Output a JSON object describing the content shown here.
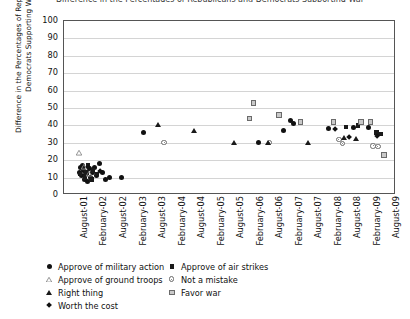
{
  "chart_data": {
    "type": "scatter",
    "title": "Difference in the Percentages of Republicans and Democrats Supporting War",
    "xlabel": "",
    "ylabel": "Difference in the Percentages of Republicans and Democrats Supporting War",
    "ylim": [
      0,
      100
    ],
    "yticks": [
      0,
      10,
      20,
      30,
      40,
      50,
      60,
      70,
      80,
      90,
      100
    ],
    "grid": true,
    "legend_position": "below-axes",
    "xticks": [
      "August-01",
      "February-02",
      "August-02",
      "February-03",
      "August-03",
      "February-04",
      "August-04",
      "February-05",
      "August-05",
      "February-06",
      "August-06",
      "February-07",
      "August-07",
      "February-08",
      "August-08",
      "February-09",
      "August-09"
    ],
    "series": [
      {
        "name": "Approve of military action",
        "marker": "circle-filled",
        "color": "#111111",
        "points": [
          {
            "x": 0.3,
            "y": 13
          },
          {
            "x": 0.36,
            "y": 16
          },
          {
            "x": 0.4,
            "y": 11
          },
          {
            "x": 0.44,
            "y": 17
          },
          {
            "x": 0.5,
            "y": 14
          },
          {
            "x": 0.55,
            "y": 9
          },
          {
            "x": 0.62,
            "y": 12
          },
          {
            "x": 0.7,
            "y": 8
          },
          {
            "x": 0.78,
            "y": 15
          },
          {
            "x": 0.85,
            "y": 10
          },
          {
            "x": 0.95,
            "y": 13
          },
          {
            "x": 1.05,
            "y": 16
          },
          {
            "x": 1.15,
            "y": 11
          },
          {
            "x": 1.3,
            "y": 18
          },
          {
            "x": 1.45,
            "y": 13
          },
          {
            "x": 1.6,
            "y": 9
          },
          {
            "x": 1.85,
            "y": 10
          },
          {
            "x": 2.45,
            "y": 10
          },
          {
            "x": 3.55,
            "y": 36
          },
          {
            "x": 9.45,
            "y": 30
          },
          {
            "x": 10.75,
            "y": 37
          },
          {
            "x": 11.1,
            "y": 43
          },
          {
            "x": 11.25,
            "y": 41
          },
          {
            "x": 13.05,
            "y": 38
          },
          {
            "x": 14.3,
            "y": 39
          },
          {
            "x": 15.1,
            "y": 39
          }
        ]
      },
      {
        "name": "Approve of air strikes",
        "marker": "square-filled",
        "color": "#1a1a1a",
        "points": [
          {
            "x": 0.33,
            "y": 12
          },
          {
            "x": 0.47,
            "y": 15
          },
          {
            "x": 0.58,
            "y": 10
          },
          {
            "x": 0.66,
            "y": 13
          },
          {
            "x": 0.74,
            "y": 17
          },
          {
            "x": 0.9,
            "y": 9
          },
          {
            "x": 1.0,
            "y": 14
          },
          {
            "x": 1.2,
            "y": 12
          },
          {
            "x": 13.95,
            "y": 39
          },
          {
            "x": 14.55,
            "y": 40
          },
          {
            "x": 15.5,
            "y": 36
          },
          {
            "x": 15.7,
            "y": 35
          }
        ]
      },
      {
        "name": "Approve of ground troops",
        "marker": "triangle-open",
        "color": "#8a8a8a",
        "points": [
          {
            "x": 0.28,
            "y": 24
          },
          {
            "x": 0.52,
            "y": 16
          },
          {
            "x": 0.8,
            "y": 12
          }
        ]
      },
      {
        "name": "Not a mistake",
        "marker": "circle-open",
        "color": "#6a6a6a",
        "points": [
          {
            "x": 4.65,
            "y": 30
          },
          {
            "x": 10.05,
            "y": 31
          },
          {
            "x": 13.6,
            "y": 34
          },
          {
            "x": 13.8,
            "y": 33
          },
          {
            "x": 15.35,
            "y": 33
          },
          {
            "x": 15.6,
            "y": 34
          }
        ]
      },
      {
        "name": "Right thing",
        "marker": "triangle-filled",
        "color": "#1a1a1a",
        "points": [
          {
            "x": 4.3,
            "y": 40
          },
          {
            "x": 6.15,
            "y": 37
          },
          {
            "x": 8.2,
            "y": 30
          },
          {
            "x": 9.95,
            "y": 30
          },
          {
            "x": 12.0,
            "y": 30
          },
          {
            "x": 13.85,
            "y": 33
          },
          {
            "x": 14.45,
            "y": 32
          }
        ]
      },
      {
        "name": "Favor war",
        "marker": "square-open",
        "color": "#6a6a6a",
        "points": [
          {
            "x": 9.2,
            "y": 53
          },
          {
            "x": 9.0,
            "y": 44
          },
          {
            "x": 10.5,
            "y": 46
          },
          {
            "x": 11.6,
            "y": 42
          },
          {
            "x": 13.3,
            "y": 42
          },
          {
            "x": 14.7,
            "y": 42
          },
          {
            "x": 15.2,
            "y": 42
          },
          {
            "x": 15.9,
            "y": 23
          }
        ]
      },
      {
        "name": "Worth the cost",
        "marker": "diamond-filled",
        "color": "#111111",
        "points": [
          {
            "x": 0.72,
            "y": 16
          },
          {
            "x": 1.35,
            "y": 14
          },
          {
            "x": 13.4,
            "y": 38
          },
          {
            "x": 14.1,
            "y": 33
          },
          {
            "x": 15.55,
            "y": 34
          }
        ]
      }
    ]
  },
  "legend": {
    "items": [
      {
        "label": "Approve of military action",
        "marker": "circle-filled"
      },
      {
        "label": "Approve of air strikes",
        "marker": "square-filled"
      },
      {
        "label": "Approve of ground troops",
        "marker": "triangle-open"
      },
      {
        "label": "Not a mistake",
        "marker": "circle-open"
      },
      {
        "label": "Right thing",
        "marker": "triangle-filled"
      },
      {
        "label": "Favor war",
        "marker": "square-open"
      },
      {
        "label": "Worth the cost",
        "marker": "diamond-filled"
      }
    ],
    "columns": [
      [
        "Approve of military action",
        "Approve of ground troops",
        "Right thing",
        "Worth the cost"
      ],
      [
        "Approve of air strikes",
        "Not a mistake",
        "Favor war"
      ]
    ]
  }
}
